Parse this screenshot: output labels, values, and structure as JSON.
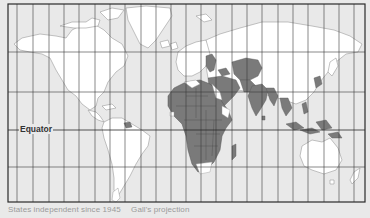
{
  "map": {
    "projection": "Gall's projection",
    "labels": {
      "equator": "Equator"
    },
    "legend": {
      "highlighted_meaning": "States independent since 1945"
    },
    "caption": {
      "text": "States independent since 1945",
      "projection": "Gall's projection"
    },
    "colors": {
      "background": "#e9e9e9",
      "land": "#ffffff",
      "highlighted": "#7a7a7a",
      "grid": "#333333",
      "border": "#8c8c8c"
    },
    "regions_highlighted": [
      "Africa (most of continent)",
      "Middle East",
      "South Asia",
      "Southeast Asia",
      "Indonesia",
      "Central Asia",
      "Mongolia",
      "Korea",
      "Baltic / Eastern Europe",
      "Suriname/Guyana",
      "Madagascar"
    ]
  }
}
